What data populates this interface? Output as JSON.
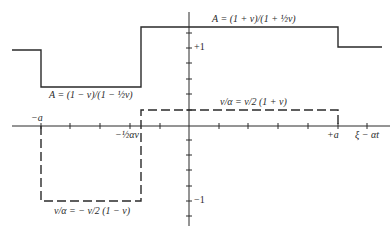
{
  "figure": {
    "type": "step-function diagram",
    "colors": {
      "ink": "#2a2a2a",
      "background": "#ffffff"
    },
    "axes": {
      "horizontal_label": "ξ − αt",
      "left_mark": "−a",
      "right_mark": "+a",
      "inner_mark": "−½αv",
      "vertical_upper_mark": "+1",
      "vertical_lower_mark": "−1"
    },
    "curves": {
      "solid": {
        "name": "A",
        "upper_label": "A = (1 + v)/(1 + ½v)",
        "lower_label": "A = (1 − v)/(1 − ½v)"
      },
      "dashed": {
        "name": "v/α",
        "upper_label": "v/α  =  v/2 (1 + v)",
        "lower_label": "v/α = − v/2  (1 − v)"
      }
    }
  }
}
